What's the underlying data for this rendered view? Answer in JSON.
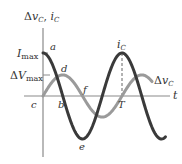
{
  "diagram": {
    "y_axis_label": {
      "delta": "Δ",
      "v": "v",
      "v_sub": "C",
      "sep": ", ",
      "i": "i",
      "i_sub": "C"
    },
    "x_axis_label": "t",
    "ticks": {
      "imax": {
        "main": "I",
        "sub": "max"
      },
      "vmax": {
        "delta": "Δ",
        "main": "V",
        "sub": "max"
      }
    },
    "points": {
      "a": "a",
      "b": "b",
      "c": "c",
      "d": "d",
      "e": "e",
      "f": "f",
      "T": "T"
    },
    "curve_labels": {
      "ic": {
        "main": "i",
        "sub": "C"
      },
      "vc": {
        "delta": "Δ",
        "main": "v",
        "sub": "C"
      }
    },
    "colors": {
      "current_curve": "#3a3a3a",
      "voltage_curve": "#9a9a9a",
      "axes": "#8a8a8a",
      "text": "#333333"
    }
  },
  "chart_data": {
    "type": "line",
    "title": "",
    "xlabel": "t",
    "ylabel": "Δv_C, i_C",
    "series": [
      {
        "name": "i_C",
        "form": "I_max cos(ωt)",
        "amplitude_label": "I_max",
        "relative_amplitude": 1.0,
        "x_periods": [
          0,
          1.55
        ]
      },
      {
        "name": "Δv_C",
        "form": "ΔV_max sin(ωt)",
        "amplitude_label": "ΔV_max",
        "relative_amplitude": 0.49,
        "x_periods": [
          0,
          1.55
        ]
      }
    ],
    "annotations": [
      {
        "label": "a",
        "at": "t=0, i_C = I_max"
      },
      {
        "label": "b",
        "at": "t=T/4, i_C = 0"
      },
      {
        "label": "c",
        "at": "origin, Δv_C = 0"
      },
      {
        "label": "d",
        "at": "t=T/4, Δv_C = ΔV_max"
      },
      {
        "label": "e",
        "at": "t=T/2, i_C = -I_max"
      },
      {
        "label": "f",
        "at": "t=T/2, Δv_C = 0"
      },
      {
        "label": "T",
        "at": "one period on t-axis, dashed line to i_C peak"
      }
    ],
    "grid": false,
    "legend": "inline labels"
  }
}
